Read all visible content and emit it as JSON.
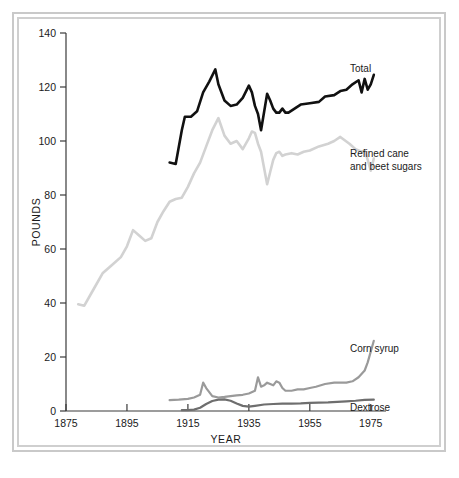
{
  "chart_data": {
    "type": "line",
    "title": "",
    "xlabel": "YEAR",
    "ylabel": "POUNDS",
    "xlim": [
      1875,
      1980
    ],
    "ylim": [
      0,
      140
    ],
    "xticks": [
      "1875",
      "1895",
      "1915",
      "1935",
      "1955",
      "1975"
    ],
    "xtick_values": [
      1875,
      1895,
      1915,
      1935,
      1955,
      1975
    ],
    "yticks": [
      "0",
      "20",
      "40",
      "60",
      "80",
      "100",
      "120",
      "140"
    ],
    "ytick_values": [
      0,
      20,
      40,
      60,
      80,
      100,
      120,
      140
    ],
    "grid": false,
    "legend_position": "right-inline-labels",
    "series": [
      {
        "name": "Total",
        "label": "Total",
        "color": "#111111",
        "width": 2.6,
        "x": [
          1909,
          1911,
          1913,
          1914,
          1916,
          1918,
          1920,
          1922,
          1924,
          1925,
          1927,
          1929,
          1931,
          1933,
          1935,
          1936,
          1937,
          1938,
          1939,
          1941,
          1942,
          1943,
          1944,
          1945,
          1946,
          1947,
          1948,
          1950,
          1952,
          1955,
          1958,
          1960,
          1963,
          1965,
          1967,
          1969,
          1971,
          1972,
          1973,
          1974,
          1975,
          1976
        ],
        "values": [
          92.0,
          91.5,
          104.0,
          109.0,
          109.0,
          111.0,
          118.0,
          122.0,
          126.5,
          121.0,
          115.0,
          113.0,
          113.5,
          116.0,
          120.5,
          118.0,
          113.0,
          110.0,
          104.0,
          117.5,
          115.0,
          112.0,
          110.5,
          110.5,
          112.0,
          110.5,
          110.5,
          112.0,
          113.5,
          114.0,
          114.5,
          116.5,
          117.0,
          118.5,
          119.0,
          121.0,
          122.5,
          118.0,
          123.0,
          119.0,
          121.0,
          124.5
        ]
      },
      {
        "name": "Refined cane and beet sugars",
        "label": "Refined cane\nand beet sugars",
        "label_line1": "Refined cane",
        "label_line2": "and beet sugars",
        "color": "#d2d2d2",
        "width": 2.6,
        "x": [
          1879,
          1881,
          1884,
          1887,
          1890,
          1893,
          1895,
          1897,
          1899,
          1901,
          1903,
          1905,
          1907,
          1909,
          1911,
          1913,
          1915,
          1917,
          1919,
          1921,
          1923,
          1925,
          1927,
          1929,
          1931,
          1933,
          1935,
          1936,
          1937,
          1938,
          1939,
          1941,
          1942,
          1943,
          1944,
          1945,
          1946,
          1947,
          1949,
          1951,
          1953,
          1955,
          1958,
          1961,
          1963,
          1965,
          1968,
          1970,
          1972,
          1973,
          1974,
          1975,
          1976
        ],
        "values": [
          39.5,
          39.0,
          45.0,
          51.0,
          54.0,
          57.0,
          61.0,
          67.0,
          65.0,
          63.0,
          64.0,
          70.0,
          74.0,
          77.5,
          78.5,
          79.0,
          83.0,
          88.0,
          92.0,
          98.0,
          104.0,
          108.5,
          102.0,
          99.0,
          100.0,
          97.0,
          101.0,
          103.5,
          103.0,
          99.0,
          96.0,
          84.0,
          88.5,
          93.0,
          95.5,
          96.0,
          94.5,
          95.0,
          95.5,
          95.0,
          96.0,
          96.5,
          98.0,
          99.0,
          100.0,
          101.5,
          99.0,
          97.0,
          96.0,
          96.5,
          93.0,
          89.0,
          93.5
        ]
      },
      {
        "name": "Corn syrup",
        "label": "Corn syrup",
        "color": "#9a9a9a",
        "width": 2.2,
        "x": [
          1909,
          1912,
          1915,
          1917,
          1919,
          1920,
          1921,
          1923,
          1925,
          1927,
          1929,
          1931,
          1933,
          1935,
          1937,
          1938,
          1939,
          1940,
          1941,
          1942,
          1943,
          1944,
          1945,
          1946,
          1947,
          1949,
          1951,
          1953,
          1955,
          1957,
          1960,
          1963,
          1965,
          1967,
          1969,
          1971,
          1973,
          1974,
          1975,
          1976
        ],
        "values": [
          4.0,
          4.2,
          4.5,
          5.0,
          6.0,
          10.5,
          8.5,
          5.5,
          5.0,
          5.2,
          5.5,
          5.8,
          6.0,
          6.5,
          7.5,
          12.5,
          9.0,
          9.5,
          10.5,
          10.0,
          9.5,
          11.0,
          10.5,
          8.5,
          7.5,
          7.5,
          8.0,
          8.0,
          8.5,
          9.0,
          10.0,
          10.5,
          10.5,
          10.5,
          11.0,
          12.5,
          15.0,
          18.0,
          22.0,
          26.0
        ]
      },
      {
        "name": "Dextrose",
        "label": "Dextrose",
        "color": "#6e6e6e",
        "width": 2.2,
        "x": [
          1913,
          1915,
          1917,
          1919,
          1921,
          1923,
          1925,
          1927,
          1929,
          1931,
          1933,
          1935,
          1937,
          1940,
          1943,
          1946,
          1949,
          1952,
          1955,
          1958,
          1961,
          1964,
          1967,
          1970,
          1973,
          1976
        ],
        "values": [
          0.3,
          0.3,
          0.5,
          1.2,
          2.6,
          3.7,
          4.2,
          4.3,
          3.8,
          2.8,
          1.9,
          1.6,
          1.9,
          2.4,
          2.6,
          2.7,
          2.7,
          2.8,
          3.0,
          3.1,
          3.2,
          3.4,
          3.6,
          3.8,
          4.1,
          4.2
        ]
      }
    ]
  },
  "axes": {
    "y_title": "POUNDS",
    "x_title": "YEAR"
  },
  "labels": {
    "total": "Total",
    "refined_line1": "Refined cane",
    "refined_line2": "and beet sugars",
    "corn_syrup": "Corn syrup",
    "dextrose": "Dextrose"
  },
  "colors": {
    "total": "#111111",
    "refined": "#d2d2d2",
    "corn": "#9a9a9a",
    "dextrose": "#6e6e6e",
    "axis": "#3a3a3a",
    "frame": "#c9c9c9",
    "background": "#ffffff"
  }
}
